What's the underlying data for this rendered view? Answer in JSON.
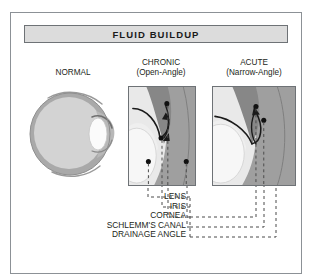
{
  "figure": {
    "title": "FLUID BUILDUP",
    "panels": [
      {
        "name": "normal",
        "caption_line1": "NORMAL",
        "caption_line2": ""
      },
      {
        "name": "chronic",
        "caption_line1": "CHRONIC",
        "caption_line2": "(Open-Angle)"
      },
      {
        "name": "acute",
        "caption_line1": "ACUTE",
        "caption_line2": "(Narrow-Angle)"
      }
    ],
    "labels": [
      {
        "text": "LENS"
      },
      {
        "text": "IRIS"
      },
      {
        "text": "CORNEA"
      },
      {
        "text": "SCHLEMM'S CANAL"
      },
      {
        "text": "DRAINAGE ANGLE"
      }
    ],
    "colors": {
      "frame": "#8c9196",
      "title_fill": "#dcdcdc",
      "title_border": "#6e7276",
      "text": "#231f20",
      "sclera": "#a8a8a8",
      "vitreous": "#d2d2d2",
      "lens": "#f4f4f4",
      "iris_dark": "#8f8f8f",
      "cornea_mid": "#bdbdbd",
      "marker": "#111111",
      "leader": "#4a4a4a"
    }
  }
}
